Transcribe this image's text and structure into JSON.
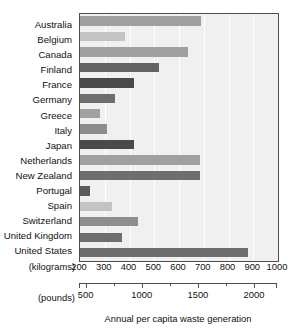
{
  "chart_data": {
    "type": "bar",
    "orientation": "horizontal",
    "title": "",
    "xlabel": "Annual per capita waste generation",
    "ylabel": "",
    "categories": [
      "Australia",
      "Belgium",
      "Canada",
      "Finland",
      "France",
      "Germany",
      "Greece",
      "Italy",
      "Japan",
      "Netherlands",
      "New Zealand",
      "Portugal",
      "Spain",
      "Switzerland",
      "United Kingdom",
      "United States"
    ],
    "values": [
      690,
      380,
      635,
      520,
      420,
      340,
      280,
      310,
      420,
      685,
      685,
      240,
      330,
      435,
      370,
      880
    ],
    "value_unit": "kilograms",
    "xlim": [
      200,
      1000
    ],
    "grid": true,
    "legend": false,
    "bar_colors": [
      "#a0a0a0",
      "#c3c3c3",
      "#a0a0a0",
      "#636363",
      "#4a4a4a",
      "#6e6e6e",
      "#a0a0a0",
      "#8d8d8d",
      "#4a4a4a",
      "#a0a0a0",
      "#6e6e6e",
      "#5a5a5a",
      "#c3c3c3",
      "#8d8d8d",
      "#6e6e6e",
      "#6e6e6e"
    ],
    "axes": [
      {
        "name": "kilograms",
        "unit_label": "(kilograms)",
        "tick_labels": [
          "200",
          "300",
          "400",
          "500",
          "600",
          "700",
          "800",
          "900",
          "1000"
        ],
        "tick_values": [
          200,
          300,
          400,
          500,
          600,
          700,
          800,
          900,
          1000
        ],
        "range": [
          200,
          1000
        ]
      },
      {
        "name": "pounds",
        "unit_label": "(pounds)",
        "tick_labels": [
          "500",
          "1000",
          "1500",
          "2000"
        ],
        "tick_values": [
          500,
          1000,
          1500,
          2000
        ],
        "minor_tick_values": [
          750,
          1250,
          1750,
          2250
        ],
        "range": [
          441,
          2205
        ]
      }
    ],
    "colors": {
      "plot_background": "#f0f0f0",
      "gridline": "#ffffff",
      "axis": "#4d4d4d",
      "text": "#111111"
    }
  }
}
